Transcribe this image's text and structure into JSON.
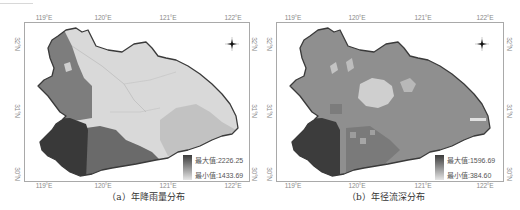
{
  "figure": {
    "type": "map_figure",
    "panels": [
      {
        "id": "a",
        "caption": "（a）年降雨量分布",
        "title": "年降雨量分布",
        "lon_ticks": [
          "119°E",
          "120°E",
          "121°E",
          "122°E"
        ],
        "lat_ticks": [
          "32°N",
          "31°N",
          "30°N"
        ],
        "legend": {
          "max_label": "最大值:2226.25",
          "min_label": "最小值:1433.69",
          "max_value": 2226.25,
          "min_value": 1433.69,
          "max_color": "#3b3b3b",
          "min_color": "#e6e6e6"
        },
        "north_arrow": "compass-rose-icon"
      },
      {
        "id": "b",
        "caption": "（b）年径流深分布",
        "title": "年径流深分布",
        "lon_ticks": [
          "119°E",
          "120°E",
          "121°E",
          "122°E"
        ],
        "lat_ticks": [
          "32°N",
          "31°N",
          "30°N"
        ],
        "legend": {
          "max_label": "最大值:1596.69",
          "min_label": "最小值:384.60",
          "max_value": 1596.69,
          "min_value": 384.6,
          "max_color": "#3b3b3b",
          "min_color": "#e6e6e6"
        },
        "north_arrow": "compass-rose-icon"
      }
    ]
  },
  "colors": {
    "frame": "#a9a9a9",
    "outline": "#3a3a3a",
    "tick_text": "#8a8a8a",
    "darkest": "#3c3c3c",
    "dark": "#6a6a6a",
    "mid": "#8c8c8c",
    "light": "#c9c9c9",
    "lightest": "#dcdcdc"
  }
}
